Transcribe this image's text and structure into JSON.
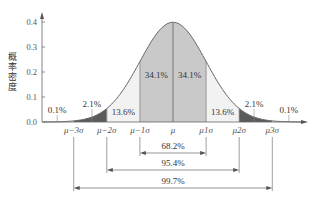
{
  "chart_data": {
    "type": "area",
    "title": "",
    "xlabel": "",
    "ylabel": "概率密度",
    "ylim": [
      0,
      0.4
    ],
    "y_ticks": [
      "0.0",
      "0.1",
      "0.2",
      "0.3",
      "0.4"
    ],
    "x_tick_labels": [
      "μ−3σ",
      "μ−2σ",
      "μ−1σ",
      "μ",
      "μ1σ",
      "μ2σ",
      "μ3σ"
    ],
    "x_tick_sigma": [
      -3,
      -2,
      -1,
      0,
      1,
      2,
      3
    ],
    "distribution": "normal",
    "regions": [
      {
        "from": -4,
        "to": -3,
        "label": "0.1%",
        "value": 0.1,
        "fill": "#ffffff"
      },
      {
        "from": -3,
        "to": -2,
        "label": "2.1%",
        "value": 2.1,
        "fill": "#5a5a5a"
      },
      {
        "from": -2,
        "to": -1,
        "label": "13.6%",
        "value": 13.6,
        "fill": "#f2f2f2"
      },
      {
        "from": -1,
        "to": 0,
        "label": "34.1%",
        "value": 34.1,
        "fill": "#c9c9c9"
      },
      {
        "from": 0,
        "to": 1,
        "label": "34.1%",
        "value": 34.1,
        "fill": "#c9c9c9"
      },
      {
        "from": 1,
        "to": 2,
        "label": "13.6%",
        "value": 13.6,
        "fill": "#f2f2f2"
      },
      {
        "from": 2,
        "to": 3,
        "label": "2.1%",
        "value": 2.1,
        "fill": "#5a5a5a"
      },
      {
        "from": 3,
        "to": 4,
        "label": "0.1%",
        "value": 0.1,
        "fill": "#ffffff"
      }
    ],
    "ranges": [
      {
        "from": -1,
        "to": 1,
        "label": "68.2%",
        "value": 68.2
      },
      {
        "from": -2,
        "to": 2,
        "label": "95.4%",
        "value": 95.4
      },
      {
        "from": -3,
        "to": 3,
        "label": "99.7%",
        "value": 99.7
      }
    ],
    "grid": false,
    "legend": null
  }
}
